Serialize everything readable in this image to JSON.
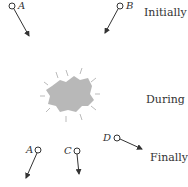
{
  "diagram": {
    "stages": {
      "initially": "Initially",
      "during": "During",
      "finally": "Finally"
    },
    "particles": {
      "initial": [
        {
          "label": "A"
        },
        {
          "label": "B"
        }
      ],
      "final": [
        {
          "label": "A"
        },
        {
          "label": "C"
        },
        {
          "label": "D"
        }
      ]
    },
    "colors": {
      "line": "#333333",
      "blob": "#b8b8b8",
      "text": "#333333"
    }
  }
}
